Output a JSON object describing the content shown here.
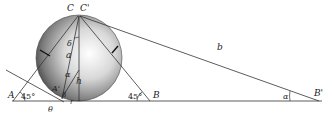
{
  "diagram": {
    "type": "geometry-figure",
    "colors": {
      "line": "#333333",
      "sphere_light": "#ffffff",
      "sphere_dark": "#5a5a5a",
      "background": "#ffffff"
    },
    "labels": {
      "C": "C",
      "C_prime": "C'",
      "A": "A",
      "A_prime": "A'",
      "B": "B",
      "B_prime": "B'",
      "a": "a",
      "b": "b",
      "h": "h",
      "r": "r",
      "delta": "δ",
      "alpha_inner": "α",
      "alpha_outer": "α",
      "beta": "β",
      "theta": "θ",
      "angle_A": "45°",
      "angle_B": "45°"
    }
  }
}
